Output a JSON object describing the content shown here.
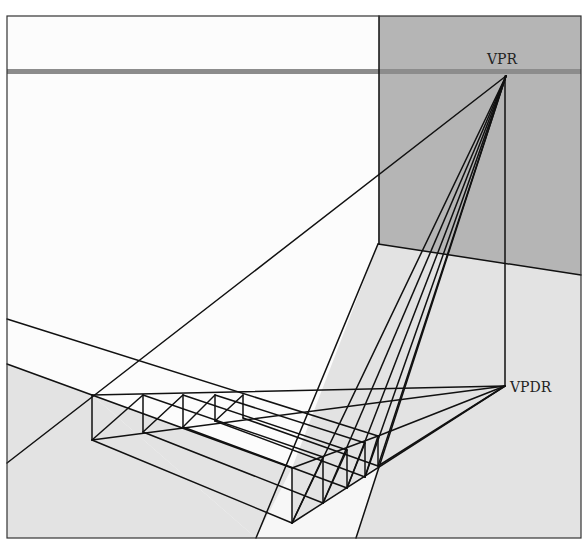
{
  "figure": {
    "labels": {
      "vpr": "VPR",
      "vpdr": "VPDR"
    },
    "colors": {
      "background": "#fcfcfc",
      "wall": "#b5b5b5",
      "floor": "#e3e3e3",
      "horizon": "#8c8c8c",
      "line": "#111111",
      "wedge": "#f7f7f7"
    },
    "points": {
      "VPR": [
        506,
        76
      ],
      "VPDR": [
        505,
        386
      ]
    }
  }
}
